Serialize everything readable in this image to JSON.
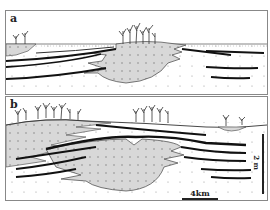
{
  "figure": {
    "panels": [
      {
        "id": "a",
        "label": "a"
      },
      {
        "id": "b",
        "label": "b"
      }
    ],
    "scale_bars": {
      "horizontal": {
        "label": "4km"
      },
      "vertical": {
        "label": "2 m"
      }
    },
    "colors": {
      "dotted_fill": "#d8d8d8",
      "line": "#222222",
      "frame": "#888888",
      "background": "#ffffff"
    }
  }
}
